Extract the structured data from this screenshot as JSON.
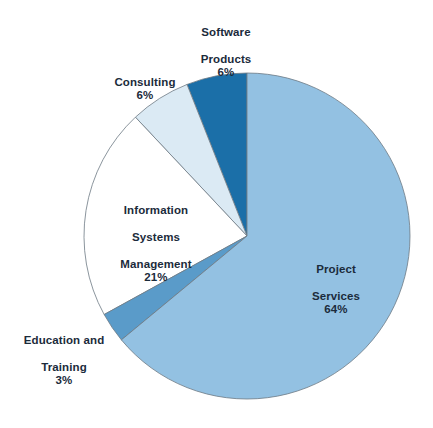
{
  "chart_data": {
    "type": "pie",
    "title": "",
    "subtitle": "",
    "xlabel": "",
    "ylabel": "",
    "legend_position": "none",
    "grid": false,
    "units": "percent",
    "start_angle_deg": 90,
    "direction": "counterclockwise",
    "categories": [
      "Software Products",
      "Consulting",
      "Information Systems Management",
      "Education and Training",
      "Project Services"
    ],
    "values": [
      6,
      6,
      21,
      3,
      64
    ],
    "slices": [
      {
        "label": "Software Products",
        "label_line1": "Software",
        "label_line2": "Products",
        "value": 6,
        "value_text": "6%",
        "color": "#1b6fa8",
        "label_placement": "outside-top"
      },
      {
        "label": "Consulting",
        "label_line1": "Consulting",
        "label_line2": "",
        "value": 6,
        "value_text": "6%",
        "color": "#dbeaf4",
        "label_placement": "outside-upper-left"
      },
      {
        "label": "Information Systems Management",
        "label_line1": "Information",
        "label_line2": "Systems",
        "label_line3": "Management",
        "value": 21,
        "value_text": "21%",
        "color": "#ffffff",
        "label_placement": "inside-left"
      },
      {
        "label": "Education and Training",
        "label_line1": "Education and",
        "label_line2": "Training",
        "value": 3,
        "value_text": "3%",
        "color": "#5a9bc9",
        "label_placement": "outside-lower-left"
      },
      {
        "label": "Project Services",
        "label_line1": "Project",
        "label_line2": "Services",
        "value": 64,
        "value_text": "64%",
        "color": "#93c1e2",
        "label_placement": "inside-right"
      }
    ]
  },
  "style": {
    "background": "#ffffff",
    "text_color": "#1b2b3b",
    "slice_outline": "#6d7a84"
  }
}
